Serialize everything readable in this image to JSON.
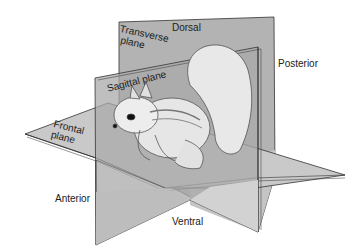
{
  "figure": {
    "planes": [
      {
        "id": "transverse",
        "label_line1": "Transverse",
        "label_line2": "plane"
      },
      {
        "id": "sagittal",
        "label_line1": "Sagittal plane"
      },
      {
        "id": "frontal",
        "label_line1": "Frontal",
        "label_line2": "plane"
      }
    ],
    "directions": {
      "dorsal": "Dorsal",
      "ventral": "Ventral",
      "anterior": "Anterior",
      "posterior": "Posterior"
    },
    "colors": {
      "plane_fill": "#b5b5b5",
      "plane_dark": "#9a9a9a",
      "plane_light": "#cfcfcf",
      "edge": "#333333",
      "text": "#222222"
    }
  }
}
